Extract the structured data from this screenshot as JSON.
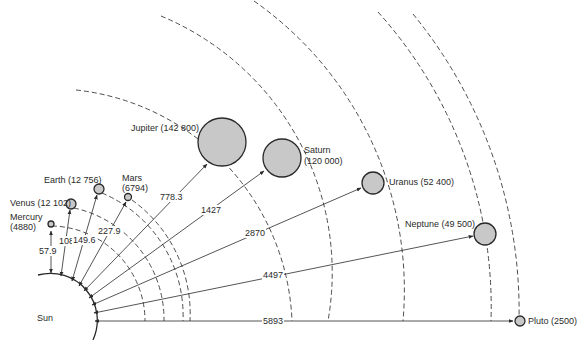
{
  "diagram": {
    "title": "",
    "sun": {
      "label": "Sun"
    },
    "colors": {
      "planet_fill": "#c8c8c8",
      "line": "#2a2a2a",
      "orbit": "#3a3a3a",
      "background": "#ffffff"
    },
    "units_note": "diameter in km (parentheses); distance from Sun in millions of km",
    "planets": [
      {
        "name": "Mercury",
        "diameter": "4880",
        "label": "Mercury",
        "label2": "(4880)",
        "distance": "57.9"
      },
      {
        "name": "Venus",
        "diameter": "12 102",
        "label": "Venus (12 102)",
        "distance": "108"
      },
      {
        "name": "Earth",
        "diameter": "12 756",
        "label": "Earth (12 756)",
        "distance": "149.6"
      },
      {
        "name": "Mars",
        "diameter": "6794",
        "label": "Mars",
        "label2": "(6794)",
        "distance": "227.9"
      },
      {
        "name": "Jupiter",
        "diameter": "142 800",
        "label": "Jupiter (142 800)",
        "distance": "778.3"
      },
      {
        "name": "Saturn",
        "diameter": "120 000",
        "label": "Saturn",
        "label2": "(120 000)",
        "distance": "1427"
      },
      {
        "name": "Uranus",
        "diameter": "52 400",
        "label": "Uranus (52 400)",
        "distance": "2870"
      },
      {
        "name": "Neptune",
        "diameter": "49 500",
        "label": "Neptune (49 500)",
        "distance": "4497"
      },
      {
        "name": "Pluto",
        "diameter": "2500",
        "label": "Pluto (2500)",
        "distance": "5893"
      }
    ]
  }
}
